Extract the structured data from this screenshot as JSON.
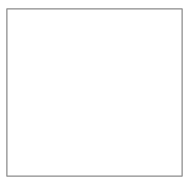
{
  "figure": {
    "kind": "geometric-tiling-diagram",
    "width": 190,
    "height": 184
  },
  "frame": {
    "x": 7,
    "y": 9,
    "width": 175,
    "height": 167,
    "stroke_color": "#8a8a8a",
    "fill_color": "#ffffff",
    "stroke_width": 1
  },
  "style": {
    "tile_stroke_color": "#6e6e6e",
    "tile_stroke_width": 0.8,
    "highlight_fill_color": "#d6d6d6",
    "highlight_stroke_color": "#7a7a7a",
    "background_color": "#ffffff"
  },
  "lattice": {
    "tile_width": 44.5,
    "tile_height": 29,
    "row_vertical_step": 29,
    "row_horizontal_offset": 22.25,
    "columns": 6,
    "rows": 8,
    "origin_x": -12,
    "origin_y": -6
  },
  "tile": {
    "name": "jagged-star-tile",
    "description": "Zigzag sawtooth polygon with interlocking upper and lower serrations that tiles the plane by translation with offset rows.",
    "unit_width": 44.5,
    "unit_height": 29,
    "outline": [
      [
        0.0,
        9.5
      ],
      [
        3.5,
        5.0
      ],
      [
        5.0,
        9.0
      ],
      [
        8.5,
        1.5
      ],
      [
        10.5,
        6.0
      ],
      [
        14.0,
        0.0
      ],
      [
        16.0,
        6.5
      ],
      [
        19.5,
        1.0
      ],
      [
        22.2,
        7.0
      ],
      [
        25.5,
        1.0
      ],
      [
        28.5,
        6.5
      ],
      [
        31.0,
        0.0
      ],
      [
        34.0,
        6.0
      ],
      [
        36.5,
        1.5
      ],
      [
        39.5,
        9.0
      ],
      [
        41.5,
        5.0
      ],
      [
        44.5,
        9.5
      ],
      [
        40.5,
        12.5
      ],
      [
        44.0,
        15.5
      ],
      [
        39.0,
        17.5
      ],
      [
        42.5,
        21.0
      ],
      [
        37.0,
        22.0
      ],
      [
        39.5,
        26.0
      ],
      [
        34.0,
        25.0
      ],
      [
        35.5,
        29.0
      ],
      [
        30.0,
        26.5
      ],
      [
        30.5,
        31.5
      ],
      [
        26.0,
        27.5
      ],
      [
        25.0,
        32.0
      ],
      [
        22.2,
        27.0
      ],
      [
        19.5,
        32.0
      ],
      [
        18.5,
        27.5
      ],
      [
        14.0,
        31.5
      ],
      [
        14.5,
        26.5
      ],
      [
        9.0,
        29.0
      ],
      [
        10.5,
        25.0
      ],
      [
        5.0,
        26.0
      ],
      [
        7.5,
        22.0
      ],
      [
        2.0,
        21.0
      ],
      [
        5.5,
        17.5
      ],
      [
        0.5,
        15.5
      ],
      [
        4.0,
        12.5
      ]
    ]
  },
  "highlight": {
    "label": "highlighted-tile",
    "row": 0,
    "column": 0,
    "fill": "#d6d6d6",
    "position_x": 10,
    "position_y": 11
  }
}
